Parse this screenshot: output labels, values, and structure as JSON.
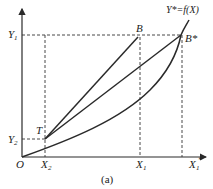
{
  "diagram": {
    "caption": "(a)",
    "curve_label": "Y*=f(X)",
    "points": {
      "origin": "O",
      "T": "T",
      "B": "B",
      "B_star": "B*"
    },
    "x_axis_labels": {
      "X2": "X",
      "X2_sub": "2",
      "X1": "X",
      "X1_sub": "1",
      "X1_star": "X",
      "X1_star_sub": "1",
      "X1_star_sup": "*"
    },
    "y_axis_labels": {
      "Y1": "Y",
      "Y1_sub": "1",
      "Y2": "Y",
      "Y2_sub": "2"
    },
    "colors": {
      "line": "#2a2a2a",
      "dashed": "#333333",
      "text": "#222222"
    }
  }
}
